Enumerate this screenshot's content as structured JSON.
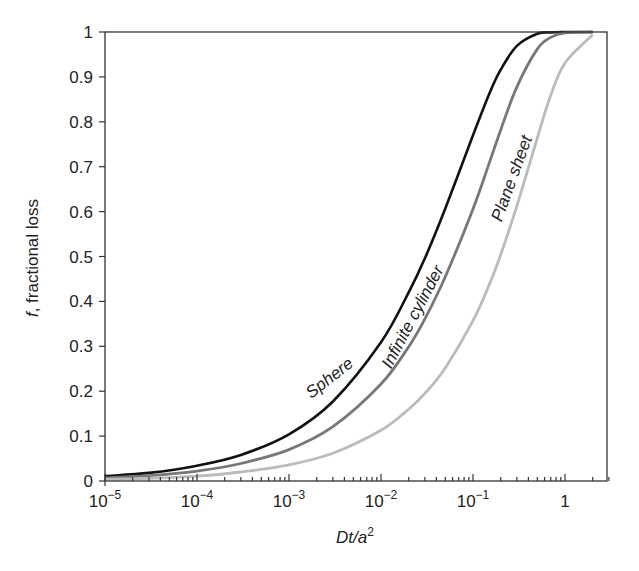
{
  "chart_data": {
    "type": "line",
    "title": "",
    "xlabel": "Dt/a²",
    "xlabel_parts": {
      "main": "Dt/a",
      "sup": "2"
    },
    "ylabel": "f, fractional loss",
    "ylabel_parts": {
      "italic": "f",
      "rest": ", fractional loss"
    },
    "xscale": "log",
    "xlim": [
      1e-05,
      3
    ],
    "ylim": [
      0,
      1
    ],
    "grid": false,
    "legend": "inline labels on curves",
    "x_ticks": [
      {
        "value": 1e-05,
        "base": "10",
        "exp": "−5"
      },
      {
        "value": 0.0001,
        "base": "10",
        "exp": "−4"
      },
      {
        "value": 0.001,
        "base": "10",
        "exp": "−3"
      },
      {
        "value": 0.01,
        "base": "10",
        "exp": "−2"
      },
      {
        "value": 0.1,
        "base": "10",
        "exp": "−1"
      },
      {
        "value": 1,
        "base": "1",
        "exp": ""
      }
    ],
    "y_ticks": [
      "0",
      "0.1",
      "0.2",
      "0.3",
      "0.4",
      "0.5",
      "0.6",
      "0.7",
      "0.8",
      "0.9",
      "1"
    ],
    "x": [
      1e-05,
      3e-05,
      0.0001,
      0.0003,
      0.001,
      0.003,
      0.01,
      0.02,
      0.03,
      0.05,
      0.1,
      0.15,
      0.2,
      0.3,
      0.5,
      0.7,
      1,
      2,
      3
    ],
    "series": [
      {
        "name": "Sphere",
        "color": "#111111",
        "values": [
          0.011,
          0.018,
          0.034,
          0.058,
          0.104,
          0.177,
          0.309,
          0.42,
          0.496,
          0.607,
          0.77,
          0.862,
          0.916,
          0.969,
          0.996,
          0.999,
          1.0,
          1.0,
          1.0
        ]
      },
      {
        "name": "Infinite cylinder",
        "color": "#777777",
        "values": [
          0.007,
          0.012,
          0.022,
          0.039,
          0.07,
          0.121,
          0.216,
          0.299,
          0.361,
          0.455,
          0.606,
          0.708,
          0.782,
          0.878,
          0.962,
          0.988,
          0.998,
          1.0,
          1.0
        ]
      },
      {
        "name": "Plane sheet",
        "color": "#bbbbbb",
        "values": [
          0.004,
          0.006,
          0.011,
          0.02,
          0.036,
          0.062,
          0.113,
          0.16,
          0.195,
          0.252,
          0.357,
          0.437,
          0.504,
          0.613,
          0.764,
          0.859,
          0.931,
          0.994,
          0.9995
        ]
      }
    ],
    "annotations": [
      {
        "text": "Sphere",
        "x": 0.003,
        "y": 0.22,
        "rotation": -38
      },
      {
        "text": "Infinite cylinder",
        "x": 0.025,
        "y": 0.36,
        "rotation": -62
      },
      {
        "text": "Plane sheet",
        "x": 0.3,
        "y": 0.67,
        "rotation": -70
      }
    ]
  }
}
